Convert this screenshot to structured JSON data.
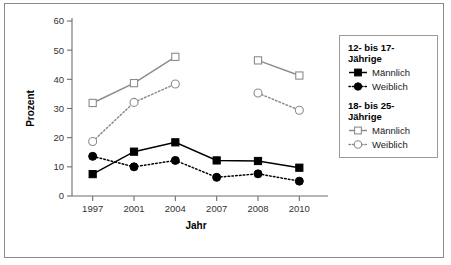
{
  "chart_data": {
    "type": "line",
    "title": "",
    "xlabel": "Jahr",
    "ylabel": "Prozent",
    "categories": [
      "1997",
      "2001",
      "2004",
      "2007",
      "2008",
      "2010"
    ],
    "ylim": [
      0,
      60
    ],
    "yticks": [
      "0",
      "10",
      "20",
      "30",
      "40",
      "50",
      "60"
    ],
    "grid": false,
    "legend_position": "right",
    "series": [
      {
        "name": "12- bis 17-Jährige Männlich",
        "group": "12- bis 17-Jährige",
        "label": "Männlich",
        "marker": "filled-square",
        "line": "solid",
        "color": "#000000",
        "values": [
          7.5,
          15.2,
          18.4,
          12.2,
          12.0,
          9.7
        ]
      },
      {
        "name": "12- bis 17-Jährige Weiblich",
        "group": "12- bis 17-Jährige",
        "label": "Weiblich",
        "marker": "filled-circle",
        "line": "dotted",
        "color": "#000000",
        "values": [
          13.6,
          10.0,
          12.2,
          6.4,
          7.6,
          5.1
        ]
      },
      {
        "name": "18- bis 25-Jährige Männlich",
        "group": "18- bis 25-Jährige",
        "label": "Männlich",
        "marker": "open-square",
        "line": "solid",
        "color": "#8c8c8c",
        "values": [
          31.9,
          38.7,
          47.7,
          null,
          46.5,
          41.3
        ]
      },
      {
        "name": "18- bis 25-Jährige Weiblich",
        "group": "18- bis 25-Jährige",
        "label": "Weiblich",
        "marker": "open-circle",
        "line": "dotted",
        "color": "#8c8c8c",
        "values": [
          18.7,
          32.1,
          38.4,
          null,
          35.3,
          29.4
        ]
      }
    ]
  },
  "legend": {
    "groups": [
      {
        "title": "12- bis 17-\nJährige",
        "entries": [
          {
            "label": "Männlich",
            "marker": "filled-square",
            "line": "solid",
            "color": "#000000"
          },
          {
            "label": "Weiblich",
            "marker": "filled-circle",
            "line": "dotted",
            "color": "#000000"
          }
        ]
      },
      {
        "title": "18- bis 25-\nJährige",
        "entries": [
          {
            "label": "Männlich",
            "marker": "open-square",
            "line": "solid",
            "color": "#8c8c8c"
          },
          {
            "label": "Weiblich",
            "marker": "open-circle",
            "line": "dotted",
            "color": "#8c8c8c"
          }
        ]
      }
    ]
  },
  "colors": {
    "black_series": "#000000",
    "gray_series": "#8c8c8c",
    "axis": "#6e6e6e",
    "frame": "#8a8a8a",
    "background": "#ffffff"
  }
}
